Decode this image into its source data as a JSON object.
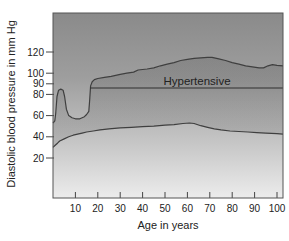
{
  "chart_data": {
    "type": "area",
    "title": "",
    "ylabel": "Diastolic blood pressure in mm Hg",
    "xlabel": "Age in years",
    "y_unit": "mm Hg",
    "x_unit": "years",
    "grid": false,
    "legend": false,
    "x_ticks": [
      10,
      20,
      30,
      40,
      50,
      60,
      70,
      80,
      90,
      100
    ],
    "y_ticks": [
      20,
      40,
      60,
      80,
      90,
      100,
      120
    ],
    "xlim": [
      0,
      103
    ],
    "ylim": [
      -18,
      157
    ],
    "hypertensive_line": {
      "label": "Hypertensive",
      "value": 86,
      "start_age": 16.6
    },
    "series": [
      {
        "name": "upper-normal-limit",
        "points": [
          [
            0,
            53
          ],
          [
            0.8,
            55
          ],
          [
            1.2,
            62
          ],
          [
            1.8,
            78
          ],
          [
            2.5,
            84
          ],
          [
            3.5,
            85
          ],
          [
            4.5,
            84
          ],
          [
            5.2,
            78
          ],
          [
            6,
            66
          ],
          [
            7,
            60
          ],
          [
            8.5,
            58
          ],
          [
            10,
            57
          ],
          [
            12,
            57
          ],
          [
            14,
            59
          ],
          [
            15,
            61
          ],
          [
            16,
            64
          ],
          [
            16.4,
            75
          ],
          [
            16.8,
            88
          ],
          [
            17.5,
            92
          ],
          [
            18.5,
            94
          ],
          [
            20,
            95
          ],
          [
            23,
            96
          ],
          [
            26,
            97
          ],
          [
            30,
            99
          ],
          [
            33,
            100
          ],
          [
            36,
            101
          ],
          [
            38,
            103
          ],
          [
            40,
            103.5
          ],
          [
            42,
            104
          ],
          [
            45,
            105
          ],
          [
            48,
            107
          ],
          [
            51,
            108.5
          ],
          [
            54,
            110
          ],
          [
            57,
            112
          ],
          [
            60,
            113
          ],
          [
            63,
            114
          ],
          [
            66,
            114.5
          ],
          [
            69,
            115
          ],
          [
            71,
            115
          ],
          [
            74,
            113.5
          ],
          [
            77,
            112
          ],
          [
            80,
            110
          ],
          [
            83,
            108.5
          ],
          [
            86,
            107
          ],
          [
            89,
            106
          ],
          [
            92,
            105
          ],
          [
            94,
            105
          ],
          [
            96,
            107
          ],
          [
            98,
            108
          ],
          [
            100,
            107.5
          ],
          [
            102.7,
            107
          ]
        ]
      },
      {
        "name": "lower-normal-limit",
        "points": [
          [
            0,
            30
          ],
          [
            1,
            32
          ],
          [
            2,
            34
          ],
          [
            3,
            36
          ],
          [
            5,
            38
          ],
          [
            7,
            40
          ],
          [
            9,
            41.5
          ],
          [
            11,
            42.5
          ],
          [
            13,
            43.5
          ],
          [
            15,
            44.5
          ],
          [
            18,
            45.5
          ],
          [
            21,
            46.5
          ],
          [
            25,
            47.5
          ],
          [
            30,
            48.5
          ],
          [
            35,
            49
          ],
          [
            40,
            49.5
          ],
          [
            45,
            50
          ],
          [
            50,
            51
          ],
          [
            54,
            51.5
          ],
          [
            58,
            52.5
          ],
          [
            61,
            53
          ],
          [
            63,
            52.5
          ],
          [
            66,
            50.5
          ],
          [
            69,
            49
          ],
          [
            72,
            47.5
          ],
          [
            75,
            46.5
          ],
          [
            79,
            45.5
          ],
          [
            83,
            45
          ],
          [
            87,
            44.5
          ],
          [
            91,
            44
          ],
          [
            95,
            43.5
          ],
          [
            100,
            43
          ],
          [
            102.7,
            42.5
          ]
        ]
      }
    ],
    "colors": {
      "plot_bg_top": "#8a8a8a",
      "plot_bg_upper_mid": "#9e9e9e",
      "plot_bg_lower_mid": "#c8c8c8",
      "plot_bg_bottom": "#ececec",
      "band_overlay": "#3c3c3c",
      "curve_stroke": "#3f3f3f",
      "hypertensive_stroke": "#2e2e2e",
      "frame_stroke": "#555555",
      "tick_stroke": "#444444",
      "text": "#222222"
    }
  }
}
